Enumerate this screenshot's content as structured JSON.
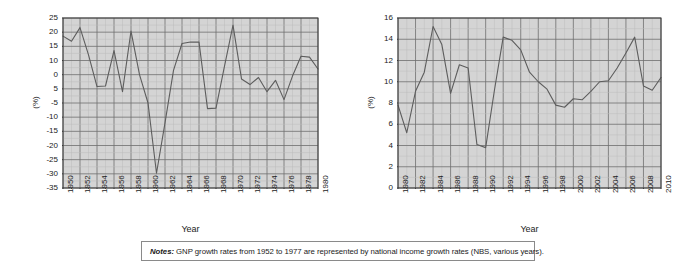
{
  "figure": {
    "notes_label": "Notes:",
    "notes_text": " GNP growth rates from 1952 to 1977 are represented by national income growth rates (NBS, various years)."
  },
  "chart_data": [
    {
      "id": "left",
      "type": "line",
      "title": "",
      "xlabel": "Year",
      "ylabel": "(%)",
      "xlim": [
        1950,
        1980
      ],
      "ylim": [
        -35,
        25
      ],
      "ytick_step": 5,
      "xtick_step": 2,
      "grid": true,
      "legend": "none",
      "ytick_labels": [
        "25",
        "20",
        "15",
        "10",
        "0",
        "5",
        "-5",
        "-10",
        "-15",
        "-20",
        "-25",
        "-30",
        "-35"
      ],
      "ytick_values": [
        25,
        20,
        15,
        10,
        5,
        0,
        -5,
        -10,
        -15,
        -20,
        -25,
        -30,
        -35
      ],
      "xtick_labels": [
        "1950",
        "1952",
        "1954",
        "1956",
        "1958",
        "1960",
        "1962",
        "1964",
        "1966",
        "1968",
        "1970",
        "1972",
        "1974",
        "1976",
        "1978",
        "1980"
      ],
      "x": [
        1950,
        1951,
        1952,
        1953,
        1954,
        1955,
        1956,
        1957,
        1958,
        1959,
        1960,
        1961,
        1962,
        1963,
        1964,
        1965,
        1966,
        1967,
        1968,
        1969,
        1970,
        1971,
        1972,
        1973,
        1974,
        1975,
        1976,
        1977,
        1978,
        1979,
        1980
      ],
      "values": [
        18.6,
        16.8,
        21.6,
        12.0,
        0.8,
        1.0,
        13.5,
        -1.0,
        20.4,
        5.0,
        -5.0,
        -29.8,
        -12.0,
        6.5,
        16.0,
        16.5,
        16.5,
        -7.0,
        -6.8,
        8.0,
        22.5,
        3.5,
        1.5,
        4.0,
        -1.0,
        3.0,
        -3.8,
        4.5,
        11.5,
        11.2,
        7.0
      ]
    },
    {
      "id": "right",
      "type": "line",
      "title": "",
      "xlabel": "Year",
      "ylabel": "(%)",
      "xlim": [
        1980,
        2010
      ],
      "ylim": [
        0,
        16
      ],
      "ytick_step": 2,
      "xtick_step": 2,
      "grid": true,
      "legend": "none",
      "ytick_labels": [
        "16",
        "14",
        "12",
        "10",
        "8",
        "6",
        "4",
        "2",
        "0"
      ],
      "ytick_values": [
        16,
        14,
        12,
        10,
        8,
        6,
        4,
        2,
        0
      ],
      "xtick_labels": [
        "1980",
        "1982",
        "1984",
        "1986",
        "1988",
        "1990",
        "1992",
        "1994",
        "1996",
        "1998",
        "2000",
        "2002",
        "2004",
        "2006",
        "2008",
        "2010"
      ],
      "x": [
        1980,
        1981,
        1982,
        1983,
        1984,
        1985,
        1986,
        1987,
        1988,
        1989,
        1990,
        1991,
        1992,
        1993,
        1994,
        1995,
        1996,
        1997,
        1998,
        1999,
        2000,
        2001,
        2002,
        2003,
        2004,
        2005,
        2006,
        2007,
        2008,
        2009,
        2010
      ],
      "values": [
        7.8,
        5.2,
        9.1,
        10.9,
        15.2,
        13.5,
        8.9,
        11.6,
        11.3,
        4.1,
        3.8,
        9.2,
        14.2,
        13.9,
        13.0,
        10.9,
        10.0,
        9.3,
        7.8,
        7.6,
        8.4,
        8.3,
        9.1,
        10.0,
        10.1,
        11.3,
        12.7,
        14.2,
        9.6,
        9.2,
        10.4
      ]
    }
  ]
}
